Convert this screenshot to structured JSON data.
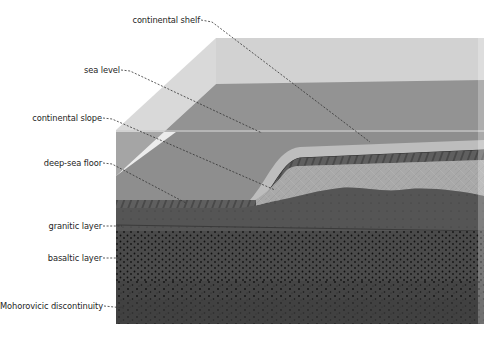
{
  "diagram": {
    "labels": [
      {
        "id": "continental-shelf",
        "text": "continental shelf",
        "x": 105,
        "y": 15,
        "w": 95
      },
      {
        "id": "sea-level",
        "text": "sea level",
        "x": 60,
        "y": 65,
        "w": 60
      },
      {
        "id": "continental-slope",
        "text": "continental slope",
        "x": 20,
        "y": 113,
        "w": 82
      },
      {
        "id": "deep-sea-floor",
        "text": "deep-sea floor",
        "x": 20,
        "y": 158,
        "w": 82
      },
      {
        "id": "granitic-layer",
        "text": "granitic layer",
        "x": 20,
        "y": 222,
        "w": 82
      },
      {
        "id": "basaltic-layer",
        "text": "basaltic layer",
        "x": 20,
        "y": 253,
        "w": 82
      },
      {
        "id": "mohorovicic-discontinuity",
        "text": "Mohorovicic discontinuity",
        "x": 0,
        "y": 301,
        "w": 103
      }
    ],
    "colors": {
      "background": "#ffffff",
      "glass_front": "#dcdcdc",
      "glass_side": "#d3d3d3",
      "back_wall": "#cfcfcf",
      "water": "#8f8f8f",
      "water_front": "#9a9a9a",
      "continental_shelf": "#b9b9b9",
      "hatched_band": "#5a5a5a",
      "granitic": "#a6a6a6",
      "crust_dark": "#3b3b3b",
      "crust_mid": "#474747",
      "leader_line": "#333333"
    }
  }
}
